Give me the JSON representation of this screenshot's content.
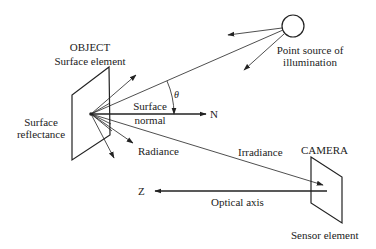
{
  "labels": {
    "object": "OBJECT",
    "surface_element": "Surface element",
    "surface_reflectance_1": "Surface",
    "surface_reflectance_2": "reflectance",
    "surface_normal_1": "Surface",
    "surface_normal_2": "normal",
    "normal_symbol": "N",
    "theta": "θ",
    "radiance": "Radiance",
    "irradiance": "Irradiance",
    "point_source_1": "Point source of",
    "point_source_2": "illumination",
    "camera": "CAMERA",
    "z_axis": "Z",
    "optical_axis": "Optical axis",
    "sensor_element": "Sensor element"
  },
  "colors": {
    "stroke": "#222222",
    "background": "#ffffff"
  }
}
